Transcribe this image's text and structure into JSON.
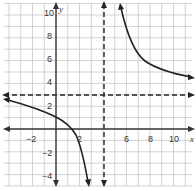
{
  "chart_data": {
    "type": "line",
    "title": "",
    "xlabel": "x",
    "ylabel": "y",
    "xlim": [
      -4.5,
      12
    ],
    "ylim": [
      -5,
      11
    ],
    "grid": true,
    "x_ticks": [
      -2,
      2,
      6,
      8,
      10
    ],
    "x_tick_labels": [
      "−2",
      "2",
      "6",
      "8",
      "10"
    ],
    "y_ticks": [
      -4,
      -2,
      2,
      4,
      6,
      8,
      10
    ],
    "y_tick_labels": [
      "−4",
      "−2",
      "2",
      "4",
      "6",
      "8",
      "10"
    ],
    "asymptotes": {
      "vertical": {
        "x": 4,
        "style": "dashed"
      },
      "horizontal": {
        "y": 3,
        "style": "dashed"
      }
    },
    "series": [
      {
        "name": "left branch",
        "points": [
          [
            -4.5,
            2.5
          ],
          [
            -2,
            1.8
          ],
          [
            0,
            1
          ],
          [
            1,
            0
          ],
          [
            2,
            -1
          ],
          [
            3,
            -5
          ]
        ]
      },
      {
        "name": "right branch",
        "points": [
          [
            4.5,
            10.5
          ],
          [
            5,
            7.5
          ],
          [
            6,
            5.5
          ],
          [
            8,
            4.3
          ],
          [
            10,
            3.8
          ],
          [
            12,
            3.5
          ]
        ]
      }
    ],
    "function_form": "rational with vertical asymptote x=4 and horizontal asymptote y=3"
  },
  "labels": {
    "x_axis": "x",
    "y_axis": "y",
    "xt": [
      "−2",
      "2",
      "6",
      "8",
      "10"
    ],
    "yt": [
      "10",
      "8",
      "6",
      "4",
      "2",
      "−2",
      "−4"
    ]
  }
}
